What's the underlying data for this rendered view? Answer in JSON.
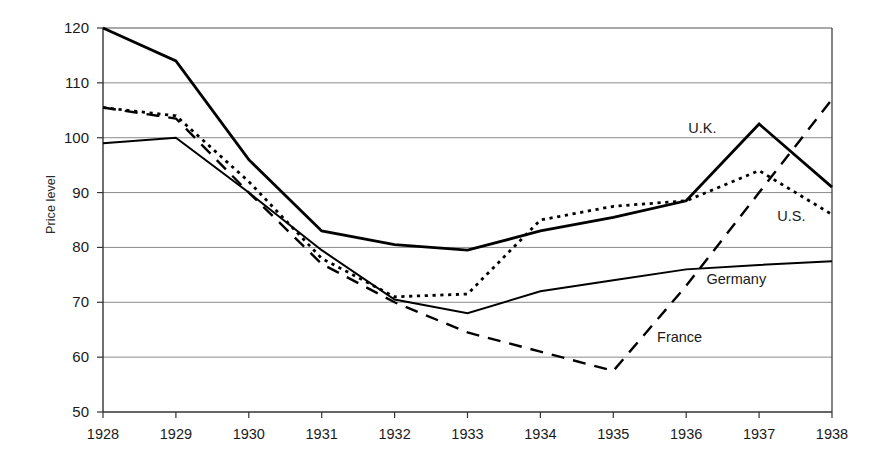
{
  "chart_data": {
    "type": "line",
    "title": "",
    "xlabel": "",
    "ylabel": "Price level",
    "x": [
      1928,
      1929,
      1930,
      1931,
      1932,
      1933,
      1934,
      1935,
      1936,
      1937,
      1938
    ],
    "xtick_labels": [
      "1928",
      "1929",
      "1930",
      "1931",
      "1932",
      "1933",
      "1934",
      "1935",
      "1936",
      "1937",
      "1938"
    ],
    "ytick_labels": [
      "50",
      "60",
      "70",
      "80",
      "90",
      "100",
      "110",
      "120"
    ],
    "yticks": [
      50,
      60,
      70,
      80,
      90,
      100,
      110,
      120
    ],
    "ylim": [
      50,
      120
    ],
    "xlim": [
      1928,
      1938
    ],
    "grid": "horizontal",
    "legend": "inline-annotations",
    "series": [
      {
        "name": "U.K.",
        "style": "solid-thick",
        "color": "#000000",
        "label_x": 1936.55,
        "label_y": 101.5,
        "values": [
          120,
          114,
          96,
          83,
          80.5,
          79.5,
          83,
          85.5,
          88.5,
          102.5,
          91
        ]
      },
      {
        "name": "U.S.",
        "style": "dotted",
        "color": "#000000",
        "label_x": 1937.25,
        "label_y": 85.5,
        "values": [
          105.5,
          104,
          92,
          78,
          71,
          71.5,
          85,
          87.5,
          88.5,
          94,
          86
        ]
      },
      {
        "name": "Germany",
        "style": "solid-thin",
        "color": "#000000",
        "label_x": 1936.8,
        "label_y": 74.0,
        "values": [
          99,
          100,
          90,
          79.5,
          70.5,
          68,
          72,
          74,
          76,
          76.8,
          77.5
        ]
      },
      {
        "name": "France",
        "style": "dashed",
        "color": "#000000",
        "label_x": 1935.6,
        "label_y": 63.5,
        "values": [
          105.5,
          103.5,
          90,
          77,
          70,
          64.5,
          61,
          57.5,
          73,
          90,
          107
        ]
      }
    ],
    "annotations": [
      {
        "text": "U.K.",
        "series": "U.K."
      },
      {
        "text": "U.S.",
        "series": "U.S."
      },
      {
        "text": "Germany",
        "series": "Germany"
      },
      {
        "text": "France",
        "series": "France"
      }
    ],
    "colors": {
      "axis": "#333333",
      "grid": "#8c8c8c",
      "line": "#000000",
      "background": "#ffffff"
    }
  }
}
